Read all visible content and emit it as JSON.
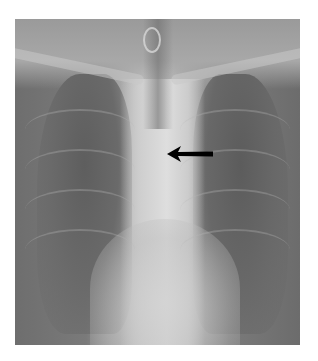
{
  "image": {
    "description": "Frontal chest radiograph (grayscale X-ray) with a black arrow annotation",
    "modality": "X-ray",
    "colors": {
      "background": "#ffffff",
      "lung_fields": "#6a6a6a",
      "mediastinum": "#d8d8d8",
      "arrow": "#000000"
    }
  },
  "annotations": [
    {
      "type": "arrow",
      "direction": "left",
      "color": "#000000",
      "label": ""
    }
  ]
}
